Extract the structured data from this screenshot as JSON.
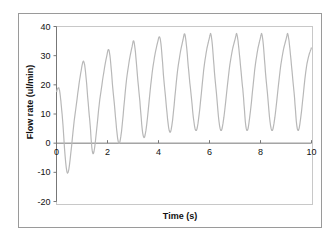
{
  "chart_data": {
    "type": "line",
    "title": "",
    "xlabel": "Time (s)",
    "ylabel": "Flow rate (ul/min)",
    "xlim": [
      0,
      10
    ],
    "ylim": [
      -20,
      40
    ],
    "x_ticks": [
      "0",
      "2",
      "4",
      "6",
      "8",
      "10"
    ],
    "y_ticks": [
      "40",
      "30",
      "20",
      "10",
      "0",
      "-10",
      "-20"
    ],
    "grid": false,
    "legend": null,
    "series": [
      {
        "name": "Flow rate",
        "color": "#b8b8b8",
        "x": [
          0,
          0.05,
          0.12,
          0.22,
          0.43,
          0.7,
          0.95,
          1.1,
          1.3,
          1.45,
          1.7,
          1.95,
          2.08,
          2.25,
          2.47,
          2.75,
          2.95,
          3.06,
          3.25,
          3.45,
          3.75,
          3.95,
          4.08,
          4.25,
          4.47,
          4.75,
          4.95,
          5.06,
          5.25,
          5.49,
          5.8,
          5.98,
          6.08,
          6.25,
          6.47,
          6.8,
          7.0,
          7.1,
          7.3,
          7.49,
          7.8,
          7.98,
          8.08,
          8.25,
          8.47,
          8.8,
          9.0,
          9.1,
          9.3,
          9.49,
          9.8,
          10.0
        ],
        "y": [
          17.5,
          18.8,
          18.0,
          10.0,
          -10.3,
          8.0,
          24.0,
          27.0,
          8.0,
          -3.5,
          15.0,
          29.0,
          31.0,
          15.0,
          0.0,
          22.0,
          32.5,
          33.8,
          16.0,
          2.0,
          24.0,
          34.0,
          35.2,
          18.0,
          3.8,
          25.0,
          35.0,
          36.2,
          19.0,
          4.4,
          27.0,
          35.5,
          36.2,
          19.0,
          4.4,
          27.0,
          35.5,
          36.2,
          19.0,
          4.4,
          27.0,
          35.5,
          36.2,
          19.0,
          4.4,
          27.0,
          35.5,
          36.2,
          19.0,
          4.4,
          26.0,
          32.8
        ]
      }
    ]
  }
}
